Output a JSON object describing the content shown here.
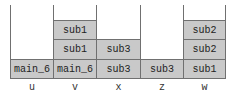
{
  "diagram": {
    "columns": [
      {
        "label": "u",
        "stack": [
          "main_6"
        ]
      },
      {
        "label": "v",
        "stack": [
          "main_6",
          "sub1",
          "sub1"
        ]
      },
      {
        "label": "x",
        "stack": [
          "sub3",
          "sub3"
        ]
      },
      {
        "label": "z",
        "stack": [
          "sub3"
        ]
      },
      {
        "label": "w",
        "stack": [
          "sub1",
          "sub2",
          "sub2"
        ]
      }
    ],
    "colors": {
      "cell_fill": "#c9c9c9",
      "border": "#707070",
      "text": "#222222"
    }
  }
}
